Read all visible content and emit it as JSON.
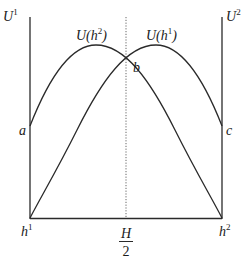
{
  "diagram": {
    "axes": {
      "left_top_label": {
        "base": "U",
        "sup": "1"
      },
      "right_top_label": {
        "base": "U",
        "sup": "2"
      },
      "bottom_left_label": {
        "base": "h",
        "sup": "1"
      },
      "bottom_right_label": {
        "base": "h",
        "sup": "2"
      },
      "midpoint_label": {
        "numerator": "H",
        "denominator": "2"
      }
    },
    "curves": [
      {
        "name": "U(h2)",
        "label_prefix": "U(",
        "label_var": "h",
        "label_sup": "2",
        "label_suffix": ")"
      },
      {
        "name": "U(h1)",
        "label_prefix": "U(",
        "label_var": "h",
        "label_sup": "1",
        "label_suffix": ")"
      }
    ],
    "points": {
      "a": "a",
      "b": "b",
      "c": "c"
    },
    "colors": {
      "line": "#2a2a2a",
      "dotted": "#555555"
    }
  }
}
